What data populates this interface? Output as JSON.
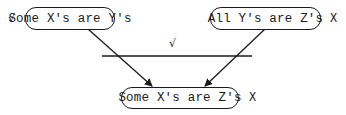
{
  "diagram": {
    "premises": [
      {
        "text": "Some X's are Y's",
        "mark": "√"
      },
      {
        "text": "All Y's are Z's",
        "mark": "X"
      }
    ],
    "inference_line_mark": "√",
    "conclusion": {
      "text": "Some X's are Z's",
      "mark": "X"
    }
  }
}
